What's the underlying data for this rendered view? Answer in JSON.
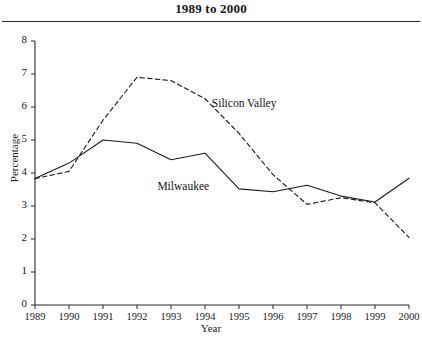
{
  "figure": {
    "title": "1989 to 2000"
  },
  "chart_data": {
    "type": "line",
    "title": "1989 to 2000",
    "xlabel": "Year",
    "ylabel": "Percentage",
    "x": [
      1989,
      1990,
      1991,
      1992,
      1993,
      1994,
      1995,
      1996,
      1997,
      1998,
      1999,
      2000
    ],
    "categories": [
      "1989",
      "1990",
      "1991",
      "1992",
      "1993",
      "1994",
      "1995",
      "1996",
      "1997",
      "1998",
      "1999",
      "2000"
    ],
    "xlim": [
      1989,
      2000
    ],
    "ylim": [
      0,
      8
    ],
    "yticks": [
      0,
      1,
      2,
      3,
      4,
      5,
      6,
      7,
      8
    ],
    "ytick_labels": [
      "0",
      "1",
      "2",
      "3",
      "4",
      "5",
      "6",
      "7",
      "8"
    ],
    "grid": false,
    "legend": "inline-annotations",
    "series": [
      {
        "name": "Silicon Valley",
        "style": "dashed",
        "color": "#1a1a1a",
        "values": [
          3.83,
          4.05,
          5.6,
          6.9,
          6.8,
          6.25,
          5.2,
          3.95,
          3.05,
          3.25,
          3.1,
          2.05
        ],
        "annotation": {
          "label": "Silicon Valley",
          "x": 1994.2,
          "y": 6.05
        }
      },
      {
        "name": "Milwaukee",
        "style": "solid",
        "color": "#1a1a1a",
        "values": [
          3.83,
          4.3,
          5.0,
          4.9,
          4.4,
          4.6,
          3.52,
          3.43,
          3.63,
          3.3,
          3.12,
          3.84
        ],
        "annotation": {
          "label": "Milwaukee",
          "x": 1992.6,
          "y": 3.55
        }
      }
    ]
  },
  "axes": {
    "y_label": "Percentage",
    "x_label": "Year"
  }
}
